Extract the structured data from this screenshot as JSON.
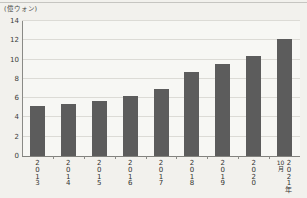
{
  "chart_data": {
    "type": "bar",
    "title": "",
    "unit": "(億ウォン)",
    "categories": [
      "2013",
      "2014",
      "2015",
      "2016",
      "2017",
      "2018",
      "2019",
      "2020",
      "2021年"
    ],
    "category_prefixes": [
      "",
      "",
      "",
      "",
      "",
      "",
      "",
      "",
      "10月"
    ],
    "values": [
      5.2,
      5.4,
      5.7,
      6.2,
      7.0,
      8.7,
      9.5,
      10.4,
      12.1
    ],
    "ylim": [
      0,
      14
    ],
    "yticks": [
      0,
      2,
      4,
      6,
      8,
      10,
      12,
      14
    ],
    "grid": "horizontal",
    "legend": "none"
  },
  "colors": {
    "bar": "#5c5c5c",
    "grid": "#dcdbd6",
    "axis": "#82827e",
    "background": "#f2f1ed",
    "plot_background": "#f7f7f4",
    "text": "#3c3c3a"
  }
}
